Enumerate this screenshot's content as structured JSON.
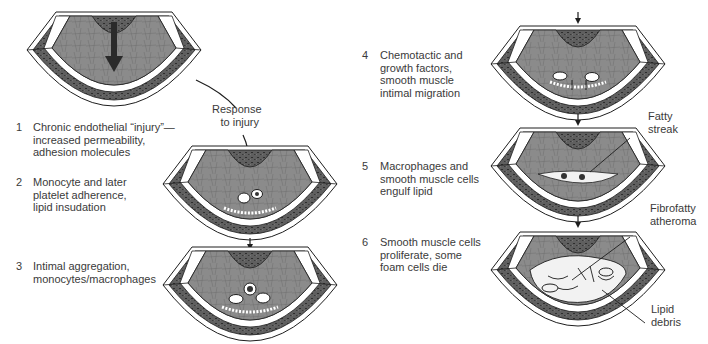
{
  "diagram": {
    "center_label": {
      "line1": "Response",
      "line2": "to injury"
    },
    "steps": [
      {
        "number": "1",
        "lines": [
          "Chronic endothelial “injury”—",
          "increased permeability,",
          "adhesion molecules"
        ]
      },
      {
        "number": "2",
        "lines": [
          "Monocyte and later",
          "platelet adherence,",
          "lipid insudation"
        ]
      },
      {
        "number": "3",
        "lines": [
          "Intimal aggregation,",
          "monocytes/macrophages"
        ]
      },
      {
        "number": "4",
        "lines": [
          "Chemotactic and",
          "growth factors,",
          "smooth muscle",
          "intimal migration"
        ]
      },
      {
        "number": "5",
        "lines": [
          "Macrophages and",
          "smooth muscle cells",
          "engulf lipid"
        ]
      },
      {
        "number": "6",
        "lines": [
          "Smooth muscle cells",
          "proliferate, some",
          "foam cells die"
        ]
      }
    ],
    "annotations": [
      {
        "id": "fatty-streak",
        "lines": [
          "Fatty",
          "streak"
        ]
      },
      {
        "id": "fibrofatty-atheroma",
        "lines": [
          "Fibrofatty",
          "atheroma"
        ]
      },
      {
        "id": "lipid-debris",
        "lines": [
          "Lipid",
          "debris"
        ]
      }
    ],
    "colors": {
      "media": "#5e5e5e",
      "intima": "#8a8a8a",
      "elastic_band": "#ffffff",
      "outline": "#1e1e1e",
      "lesion": "#f2f2f2",
      "arrow": "#2a2a2a"
    }
  }
}
